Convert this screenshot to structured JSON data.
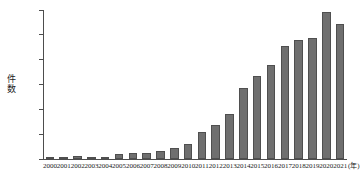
{
  "chart_data": {
    "type": "bar",
    "title": "",
    "subtitle": "",
    "xlabel": "(年)",
    "ylabel": "件数",
    "ylim": [
      0,
      1200
    ],
    "ytick_step": 200,
    "yticks": [
      "1200",
      "1000",
      "800",
      "600",
      "400",
      "200",
      "0"
    ],
    "ytick_values": [
      1200,
      1000,
      800,
      600,
      400,
      200,
      0
    ],
    "grid": false,
    "legend": "none",
    "bar_color": "#6f6f6f",
    "bar_edge_color": "#4f6f4f",
    "axis_color": "#4d4d4d",
    "categories": [
      "2000",
      "2001",
      "2002",
      "2003",
      "2004",
      "2005",
      "2006",
      "2007",
      "2008",
      "2009",
      "2010",
      "2011",
      "2012",
      "2013",
      "2014",
      "2015",
      "2016",
      "2017",
      "2018",
      "2019",
      "2020",
      "2021"
    ],
    "values": [
      10,
      12,
      22,
      15,
      18,
      40,
      48,
      46,
      62,
      85,
      120,
      218,
      275,
      365,
      570,
      672,
      758,
      908,
      958,
      978,
      1180,
      1088
    ],
    "series": [
      {
        "name": "件数",
        "values": [
          10,
          12,
          22,
          15,
          18,
          40,
          48,
          46,
          62,
          85,
          120,
          218,
          275,
          365,
          570,
          672,
          758,
          908,
          958,
          978,
          1180,
          1088
        ]
      }
    ]
  },
  "axis": {
    "y_title_chars": [
      "件",
      "数"
    ],
    "x_unit_label": "(年)"
  }
}
